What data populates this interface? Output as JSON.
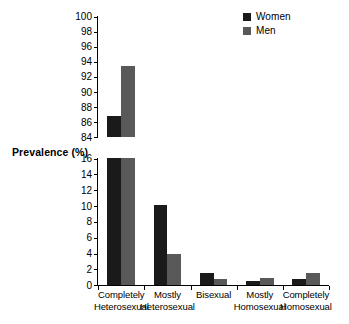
{
  "chart_data": {
    "type": "bar",
    "title": "",
    "subtitle": "",
    "xlabel": "",
    "ylabel": "Prevalence (%)",
    "grid": false,
    "legend_position": "top-right",
    "broken_axis": true,
    "categories": [
      "Completely\nHeterosexual",
      "Mostly\nHeterosexual",
      "Bisexual",
      "Mostly\nHomosexual",
      "Completely\nHomosexual"
    ],
    "category_lines": [
      [
        "Completely",
        "Heterosexual"
      ],
      [
        "Mostly",
        "Heterosexual"
      ],
      [
        "Bisexual",
        ""
      ],
      [
        "Mostly",
        "Homosexual"
      ],
      [
        "Completely",
        "Homosexual"
      ]
    ],
    "series": [
      {
        "name": "Women",
        "color": "#1a1a1a",
        "values": [
          86.7,
          10.1,
          1.5,
          0.5,
          0.7
        ]
      },
      {
        "name": "Men",
        "color": "#595959",
        "values": [
          93.4,
          3.9,
          0.7,
          0.8,
          1.5
        ]
      }
    ],
    "axes": [
      {
        "id": "upper",
        "ylim": [
          84,
          100
        ],
        "ticks": [
          84,
          86,
          88,
          90,
          92,
          94,
          96,
          98,
          100
        ],
        "tick_labels": [
          "84",
          "86",
          "88",
          "90",
          "92",
          "94",
          "96",
          "98",
          "100"
        ]
      },
      {
        "id": "lower",
        "ylim": [
          0,
          16
        ],
        "ticks": [
          0,
          2,
          4,
          6,
          8,
          10,
          12,
          14,
          16
        ],
        "tick_labels": [
          "0",
          "2",
          "4",
          "6",
          "8",
          "10",
          "12",
          "14",
          "16"
        ]
      }
    ]
  },
  "legend": {
    "items": [
      {
        "label": "Women",
        "color": "#1a1a1a"
      },
      {
        "label": "Men",
        "color": "#595959"
      }
    ]
  },
  "y_axis_title": "Prevalence (%)"
}
